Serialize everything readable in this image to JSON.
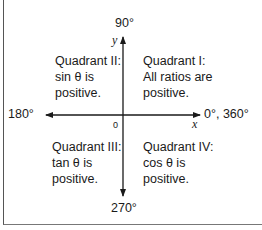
{
  "axes": {
    "top_label": "90°",
    "left_label": "180°",
    "right_label": "0°, 360°",
    "bottom_label": "270°",
    "y_label": "y",
    "x_label": "x",
    "origin_label": "0"
  },
  "quadrants": [
    {
      "id": "I",
      "lines": [
        "Quadrant I:",
        "All ratios are",
        "positive."
      ]
    },
    {
      "id": "II",
      "lines": [
        "Quadrant II:",
        "sin θ is",
        "positive."
      ]
    },
    {
      "id": "III",
      "lines": [
        "Quadrant III:",
        "tan θ is",
        "positive."
      ]
    },
    {
      "id": "IV",
      "lines": [
        "Quadrant IV:",
        "cos θ is",
        "positive."
      ]
    }
  ],
  "colors": {
    "axis": "#1a1a1a",
    "frame": "#666666"
  }
}
